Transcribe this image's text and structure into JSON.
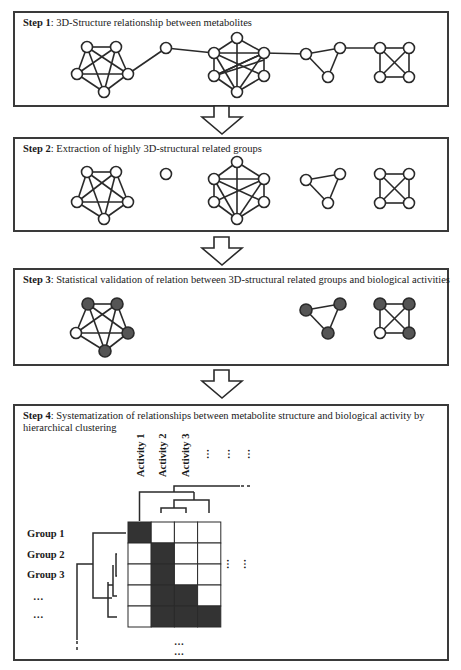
{
  "steps": [
    {
      "label": "Step 1",
      "text": ": 3D-Structure relationship between metabolites"
    },
    {
      "label": "Step 2",
      "text": ": Extraction of highly 3D-structural related groups"
    },
    {
      "label": "Step 3",
      "text": ": Statistical validation of relation between 3D-structural related groups and biological activities"
    },
    {
      "label": "Step 4",
      "text": ": Systematization of relationships between metabolite structure and biological activity by hierarchical clustering"
    }
  ],
  "activities": [
    "Activity 1",
    "Activity 2",
    "Activity 3"
  ],
  "activity_more": [
    "…",
    "…",
    "…"
  ],
  "groups": [
    "Group 1",
    "Group 2",
    "Group 3",
    "…",
    "…"
  ],
  "row_more": [
    "…",
    "…"
  ],
  "col_more": [
    "…",
    "…"
  ],
  "heatmap": {
    "rows": 5,
    "cols": 4,
    "cells": [
      [
        1,
        0,
        0,
        0
      ],
      [
        0,
        1,
        0,
        0
      ],
      [
        0,
        1,
        0,
        0
      ],
      [
        0,
        1,
        1,
        0
      ],
      [
        0,
        1,
        1,
        1
      ]
    ],
    "filled_color": "#333333",
    "empty_color": "#ffffff"
  },
  "node_colors": {
    "empty": "#ffffff",
    "active": "#555555",
    "stroke": "#2a2a2a"
  }
}
